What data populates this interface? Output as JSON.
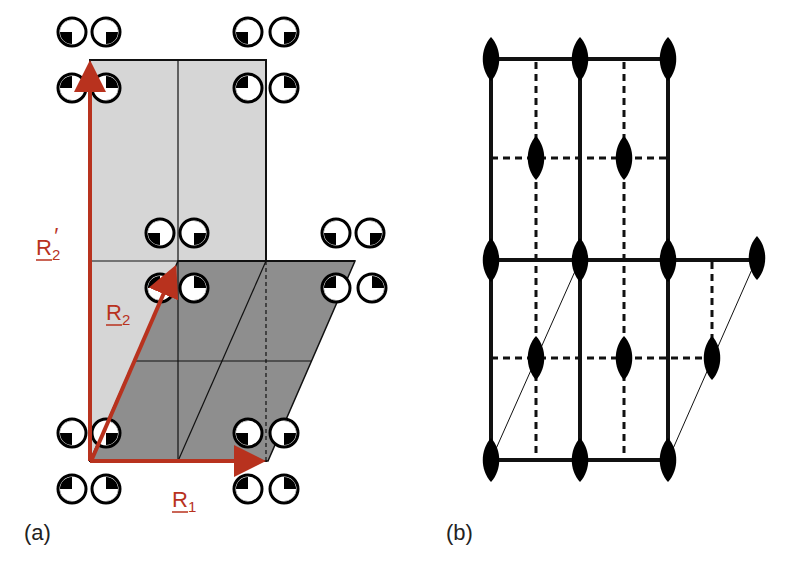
{
  "figure": {
    "panels": [
      {
        "id": "a",
        "label": "(a)",
        "vectors": [
          {
            "name": "R1",
            "label": "R",
            "subscript": "1",
            "prime": ""
          },
          {
            "name": "R2",
            "label": "R",
            "subscript": "2",
            "prime": ""
          },
          {
            "name": "R2prime",
            "label": "R",
            "subscript": "2",
            "prime": "′"
          }
        ],
        "cells": {
          "rectangular_cell": "light-gray shaded rectangle spanned by R1 and R2′",
          "primitive_cell": "dark-gray parallelogram spanned by R1 and R2"
        },
        "motif_symbol": "circle-with-filled-quadrant"
      },
      {
        "id": "b",
        "label": "(b)",
        "symmetry_symbol": "twofold-rotation-axis-lens",
        "lines": {
          "solid": "mirror lines",
          "dashed": "glide lines"
        }
      }
    ],
    "colors": {
      "vector": "#b8321e",
      "light_cell": "#d6d6d6",
      "dark_cell": "#8e8e8e",
      "line": "#111111"
    }
  }
}
